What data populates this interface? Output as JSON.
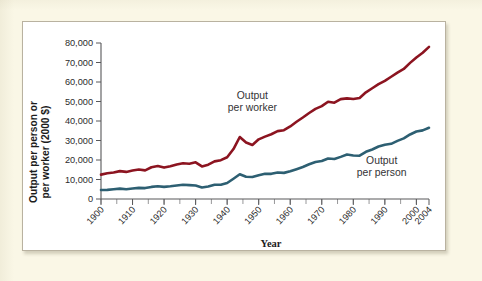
{
  "figure": {
    "page_background": "#faf7e6",
    "panel_background": "#ffffff",
    "panel_border_color": "#b9b2a0"
  },
  "chart_data": {
    "type": "line",
    "title": "",
    "subtitle": "",
    "xlabel": "Year",
    "ylabel": "Output per person or per worker (2000 $)",
    "ylabel_line1": "Output per person or",
    "ylabel_line2": "per worker (2000 $)",
    "grid": false,
    "legend_position": "inline-annotations",
    "xlim": [
      1900,
      2004
    ],
    "ylim": [
      0,
      80000
    ],
    "xticks": [
      1900,
      1910,
      1920,
      1930,
      1940,
      1950,
      1960,
      1970,
      1980,
      1990,
      2000,
      2004
    ],
    "xtick_labels": [
      "1900",
      "1910",
      "1920",
      "1930",
      "1940",
      "1950",
      "1960",
      "1970",
      "1980",
      "1990",
      "2000",
      "2004"
    ],
    "xminor_step": 5,
    "yticks": [
      0,
      10000,
      20000,
      30000,
      40000,
      50000,
      60000,
      70000,
      80000
    ],
    "ytick_labels": [
      "0",
      "10,000",
      "20,000",
      "30,000",
      "40,000",
      "50,000",
      "60,000",
      "70,000",
      "80,000"
    ],
    "annotations": [
      {
        "name": "output-per-worker",
        "line1": "Output",
        "line2": "per worker",
        "x_data": 1948,
        "y_data": 51500,
        "anchor": "middle",
        "color": "#333335"
      },
      {
        "name": "output-per-person",
        "line1": "Output",
        "line2": "per person",
        "x_data": 1989,
        "y_data": 17800,
        "anchor": "middle",
        "color": "#333335"
      }
    ],
    "x": [
      1900,
      1902,
      1904,
      1906,
      1908,
      1910,
      1912,
      1914,
      1916,
      1918,
      1920,
      1922,
      1924,
      1926,
      1928,
      1930,
      1932,
      1934,
      1936,
      1938,
      1940,
      1942,
      1944,
      1946,
      1948,
      1950,
      1952,
      1954,
      1956,
      1958,
      1960,
      1962,
      1964,
      1966,
      1968,
      1970,
      1972,
      1974,
      1976,
      1978,
      1980,
      1982,
      1984,
      1986,
      1988,
      1990,
      1992,
      1994,
      1996,
      1998,
      2000,
      2002,
      2004
    ],
    "series": [
      {
        "name": "Output per worker",
        "color": "#8c1420",
        "width": 2.6,
        "values": [
          12500,
          13200,
          13600,
          14300,
          13900,
          14600,
          15100,
          14700,
          16300,
          16900,
          16100,
          16800,
          17700,
          18300,
          18100,
          18800,
          16700,
          17600,
          19300,
          19900,
          21400,
          25600,
          31800,
          29000,
          27700,
          30600,
          32000,
          33200,
          34800,
          35300,
          37200,
          39600,
          41800,
          44100,
          46200,
          47600,
          49900,
          49400,
          51200,
          51600,
          51300,
          51800,
          54700,
          56800,
          58900,
          60600,
          62700,
          64800,
          66700,
          69800,
          72600,
          75000,
          78000
        ]
      },
      {
        "name": "Output per person",
        "color": "#2d5f72",
        "width": 2.6,
        "values": [
          4600,
          4700,
          5000,
          5300,
          5000,
          5400,
          5700,
          5600,
          6200,
          6500,
          6200,
          6500,
          6900,
          7300,
          7100,
          6900,
          5900,
          6400,
          7300,
          7300,
          8200,
          10400,
          12700,
          11400,
          11300,
          12200,
          12900,
          12900,
          13600,
          13400,
          14200,
          15300,
          16400,
          17800,
          19000,
          19500,
          20800,
          20500,
          21600,
          22800,
          22300,
          22200,
          24200,
          25400,
          26900,
          27800,
          28300,
          29800,
          31100,
          33100,
          34600,
          35200,
          36500
        ]
      }
    ]
  }
}
